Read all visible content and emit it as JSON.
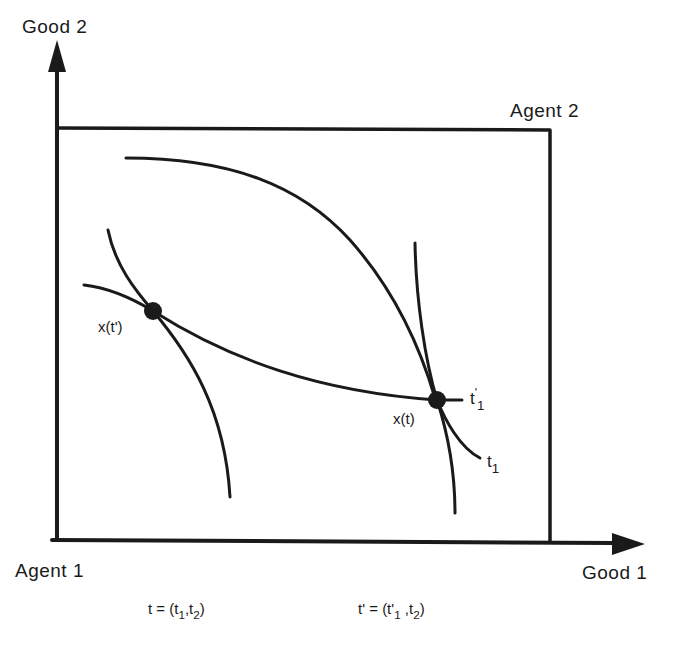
{
  "diagram": {
    "type": "edgeworth-box",
    "axes": {
      "y_label": "Good 2",
      "x_label": "Good 1"
    },
    "origins": {
      "agent1": "Agent 1",
      "agent2": "Agent 2"
    },
    "points": {
      "x_t_prime": "x(t')",
      "x_t": "x(t)"
    },
    "curve_labels": {
      "t1_prime_base": "t",
      "t1_prime_mark": "'",
      "t1_prime_sub": "1",
      "t1_base": "t",
      "t1_sub": "1"
    },
    "definitions": {
      "t_def_prefix": "t = (t",
      "t_def_sub1": "1",
      "t_def_mid": ",t",
      "t_def_sub2": "2",
      "t_def_suffix": ")",
      "tp_def_prefix": "t' = (t'",
      "tp_def_sub1": "1",
      "tp_def_mid": " ,t",
      "tp_def_sub2": "2",
      "tp_def_suffix": ")"
    },
    "colors": {
      "ink": "#1a1a1a",
      "background": "#ffffff"
    }
  }
}
